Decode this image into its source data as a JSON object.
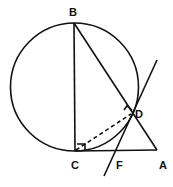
{
  "diagram": {
    "labels": {
      "B": "B",
      "C": "C",
      "D": "D",
      "F": "F",
      "A": "A"
    },
    "points": {
      "B": [
        74,
        23
      ],
      "C": [
        75,
        151
      ],
      "A": [
        157,
        150
      ],
      "D": [
        132,
        113
      ],
      "F": [
        117,
        151
      ]
    },
    "circle": {
      "cx": 74.5,
      "cy": 87,
      "r": 64
    },
    "colors": {
      "ink": "#111111",
      "background": "#ffffff"
    }
  }
}
